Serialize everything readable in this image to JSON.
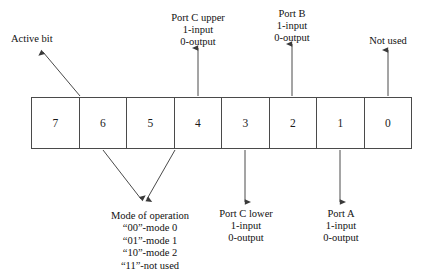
{
  "diagram": {
    "line_color": "#4a4a4a",
    "text_color": "#111111",
    "background": "#ffffff"
  },
  "bits": [
    {
      "label": "7"
    },
    {
      "label": "6"
    },
    {
      "label": "5"
    },
    {
      "label": "4"
    },
    {
      "label": "3"
    },
    {
      "label": "2"
    },
    {
      "label": "1"
    },
    {
      "label": "0"
    }
  ],
  "callouts": {
    "active_bit": "Active bit",
    "port_c_upper": {
      "line1": "Port C upper",
      "line2": "1-input",
      "line3": "0-output"
    },
    "port_b": {
      "line1": "Port B",
      "line2": "1-input",
      "line3": "0-output"
    },
    "not_used": "Not used",
    "port_c_lower": {
      "line1": "Port C lower",
      "line2": "1-input",
      "line3": "0-output"
    },
    "port_a": {
      "line1": "Port A",
      "line2": "1-input",
      "line3": "0-output"
    },
    "mode": {
      "title": "Mode of operation",
      "entries": [
        "“00”-mode 0",
        "“01”-mode 1",
        "“10”-mode 2",
        "“11”-not used"
      ]
    }
  }
}
